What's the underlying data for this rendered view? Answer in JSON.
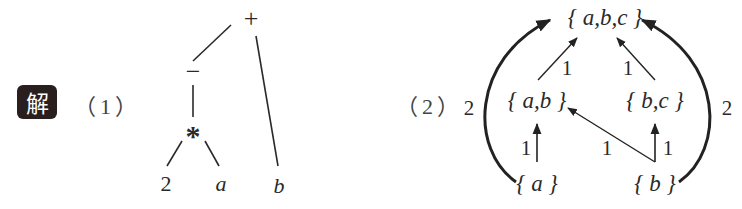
{
  "badge": {
    "label": "解",
    "background": "#2a1f1f",
    "color": "#ffffff"
  },
  "part1": {
    "label": "（1）",
    "tree": {
      "nodes": [
        {
          "id": "plus",
          "text": "+"
        },
        {
          "id": "minus",
          "text": "−"
        },
        {
          "id": "star",
          "text": "*"
        },
        {
          "id": "two",
          "text": "2"
        },
        {
          "id": "a",
          "text": "a"
        },
        {
          "id": "b",
          "text": "b"
        }
      ],
      "edges": [
        [
          "plus",
          "minus"
        ],
        [
          "plus",
          "b"
        ],
        [
          "minus",
          "star"
        ],
        [
          "star",
          "two"
        ],
        [
          "star",
          "a"
        ]
      ]
    }
  },
  "part2": {
    "label": "（2）",
    "lattice": {
      "nodes": [
        {
          "id": "abc",
          "text": "{ a,b,c }"
        },
        {
          "id": "ab",
          "text": "{ a,b }"
        },
        {
          "id": "bc",
          "text": "{ b,c }"
        },
        {
          "id": "a",
          "text": "{ a }"
        },
        {
          "id": "b",
          "text": "{ b }"
        }
      ],
      "edges": [
        {
          "from": "ab",
          "to": "abc",
          "weight": "1"
        },
        {
          "from": "bc",
          "to": "abc",
          "weight": "1"
        },
        {
          "from": "a",
          "to": "ab",
          "weight": "1"
        },
        {
          "from": "b",
          "to": "ab",
          "weight": "1"
        },
        {
          "from": "b",
          "to": "bc",
          "weight": "1"
        },
        {
          "from": "a",
          "to": "abc",
          "weight": "2",
          "style": "bold-curve"
        },
        {
          "from": "b",
          "to": "abc",
          "weight": "2",
          "style": "bold-curve"
        }
      ]
    }
  }
}
